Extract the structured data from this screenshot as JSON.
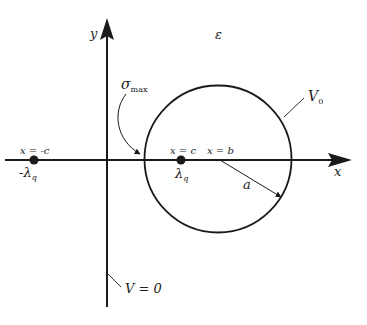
{
  "diagram": {
    "medium_label": "ε",
    "axes": {
      "x_label": "x",
      "y_label": "y"
    },
    "labels": {
      "sigma": "σ",
      "sigma_sub": "max",
      "v0": "V",
      "v0_sub": "0",
      "v_zero": "V = 0",
      "x_neg_c": "x = -c",
      "x_c": "x = c",
      "x_b": "x = b",
      "lambda_neg": "-λ",
      "lambda_neg_sub": "q",
      "lambda_pos": "λ",
      "lambda_pos_sub": "q",
      "radius": "a"
    },
    "colors": {
      "stroke": "#1a1a1a",
      "background": "#ffffff"
    }
  }
}
